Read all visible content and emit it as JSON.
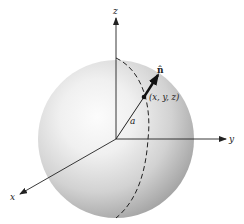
{
  "figure": {
    "colors": {
      "background": "#ffffff",
      "sphere_highlight": "#fbfbfb",
      "sphere_mid": "#dcdcdc",
      "sphere_edge": "#9a9a9a",
      "lines": "#222222"
    },
    "axes": {
      "x_label": "x",
      "y_label": "y",
      "z_label": "z"
    },
    "vector": {
      "label": "n̂",
      "point_label": "(x, y, z)",
      "radius_label": "a"
    },
    "meridian": {
      "style": "dashed"
    }
  }
}
